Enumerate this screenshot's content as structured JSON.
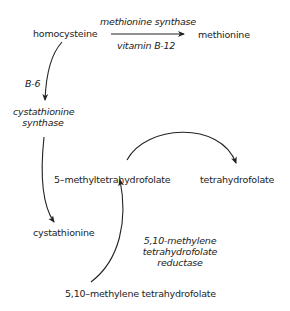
{
  "diagram": {
    "nodes": {
      "homocysteine": "homocysteine",
      "methionine": "methionine",
      "cystathionine": "cystathionine",
      "methyl_thf": "5–methyltetrahydrofolate",
      "thf": "tetrahydrofolate",
      "methylene_thf": "5,10–methylene tetrahydrofolate"
    },
    "enzymes": {
      "methionine_synthase": "methionine synthase",
      "vitamin_b12": "vitamin B-12",
      "b6": "B-6",
      "cbs_line1": "cystathionine",
      "cbs_line2": "synthase",
      "mthfr_line1": "5,10-methylene",
      "mthfr_line2": "tetrahydrofolate",
      "mthfr_line3": "reductase"
    },
    "edges": [
      {
        "from": "homocysteine",
        "to": "methionine",
        "label": "methionine synthase / vitamin B-12"
      },
      {
        "from": "homocysteine",
        "to": "cystathionine",
        "label": "B-6 / cystathionine synthase"
      },
      {
        "from": "methyl_thf",
        "to": "thf",
        "label": ""
      },
      {
        "from": "methylene_thf",
        "to": "methyl_thf",
        "label": "5,10-methylene tetrahydrofolate reductase"
      }
    ]
  }
}
